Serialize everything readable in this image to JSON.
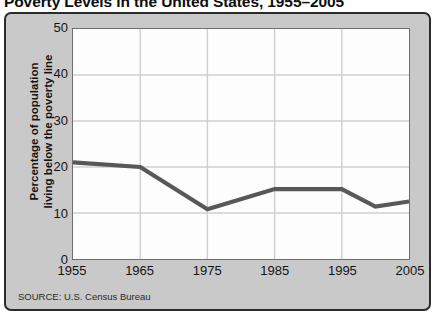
{
  "title": "Poverty Levels in the United States, 1955–2005",
  "source_note": "SOURCE: U.S. Census Bureau",
  "y_axis_title_line1": "Percentage of population",
  "y_axis_title_line2": "living below the poverty line",
  "colors": {
    "panel_background": "#c9c9c9",
    "panel_border": "#2b2b2b",
    "plot_background": "#fdfdfd",
    "plot_border": "#6e6e6e",
    "gridline": "#cfcfcf",
    "series_line": "#585858",
    "text": "#141414"
  },
  "chart_data": {
    "type": "line",
    "title": "Poverty Levels in the United States, 1955–2005",
    "xlabel": "",
    "ylabel": "Percentage of population living below the poverty line",
    "xlim": [
      1955,
      2005
    ],
    "ylim": [
      0,
      50
    ],
    "grid": true,
    "legend": "none",
    "xticks": [
      "1955",
      "1965",
      "1975",
      "1985",
      "1995",
      "2005"
    ],
    "xtick_values": [
      1955,
      1965,
      1975,
      1985,
      1995,
      2005
    ],
    "yticks": [
      "0",
      "10",
      "20",
      "30",
      "40",
      "50"
    ],
    "ytick_values": [
      0,
      10,
      20,
      30,
      40,
      50
    ],
    "series": [
      {
        "name": "Percentage below poverty line",
        "x": [
          1955,
          1965,
          1975,
          1985,
          1995,
          2000,
          2005
        ],
        "values": [
          21.0,
          20.0,
          10.8,
          15.2,
          15.2,
          11.4,
          12.5
        ]
      }
    ]
  }
}
